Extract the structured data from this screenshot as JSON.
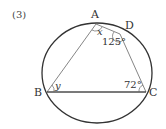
{
  "problem_number": "(3)",
  "points": {
    "A": {
      "label": "A",
      "x": 96,
      "y": 24
    },
    "B": {
      "label": "B",
      "x": 47,
      "y": 92
    },
    "C": {
      "label": "C",
      "x": 146,
      "y": 92
    },
    "D": {
      "label": "D",
      "x": 120,
      "y": 34
    }
  },
  "circle": {
    "cx": 97,
    "cy": 73,
    "rx": 55,
    "ry": 50
  },
  "angles": {
    "x": "x",
    "y": "y",
    "angle_D": "125°",
    "angle_C": "72°"
  },
  "colors": {
    "stroke": "#333333",
    "thin_stroke": "#666666"
  }
}
